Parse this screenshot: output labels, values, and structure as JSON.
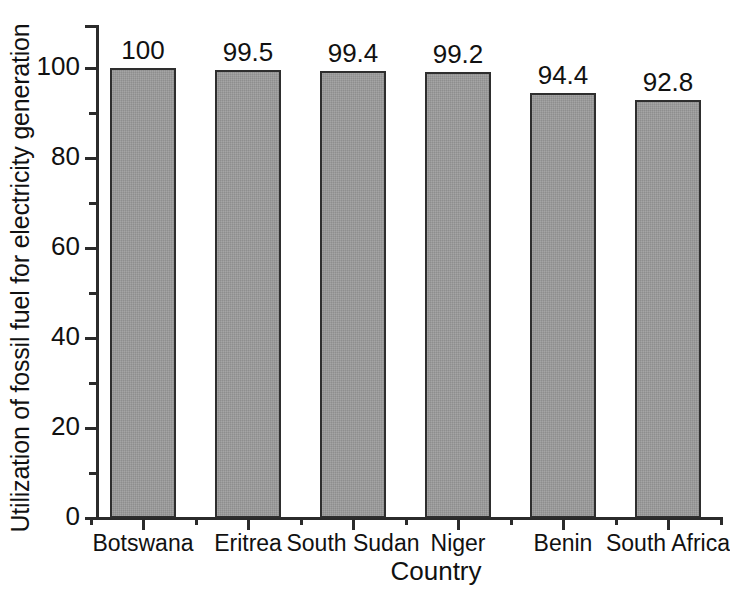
{
  "chart_data": {
    "type": "bar",
    "title": "",
    "subtitle": "",
    "xlabel": "Country",
    "ylabel": "Utilization of fossil fuel for electricity generation",
    "categories": [
      "Botswana",
      "Eritrea",
      "South Sudan",
      "Niger",
      "Benin",
      "South Africa"
    ],
    "values": [
      100,
      99.5,
      99.4,
      99.2,
      94.4,
      92.8
    ],
    "value_labels": [
      "100",
      "99.5",
      "99.4",
      "99.2",
      "94.4",
      "92.8"
    ],
    "ylim": [
      0,
      110
    ],
    "yticks": [
      0,
      20,
      40,
      60,
      80,
      100
    ],
    "ytick_labels": [
      "0",
      "20",
      "40",
      "60",
      "80",
      "100"
    ],
    "yminor_ticks": [
      10,
      30,
      50,
      70,
      90
    ],
    "grid": false,
    "legend": null,
    "legend_position": "none",
    "bar_color": "#9c9c9c",
    "bar_edge_color": "#2e2e2e",
    "axis_color": "#2b2b2b",
    "background_color": "#ffffff"
  }
}
